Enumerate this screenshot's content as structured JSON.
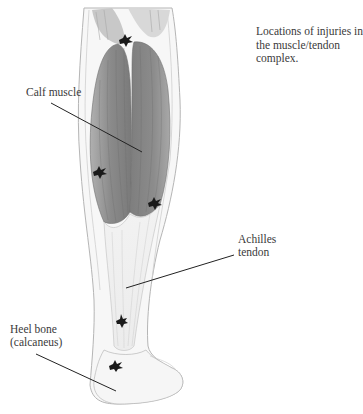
{
  "figure": {
    "caption_lines": [
      "Locations of injuries in",
      "the muscle/tendon",
      "complex."
    ],
    "labels": {
      "calf_muscle": "Calf muscle",
      "achilles_line1": "Achilles",
      "achilles_line2": "tendon",
      "heel_line1": "Heel bone",
      "heel_line2": "(calcaneus)"
    },
    "injury_markers": [
      {
        "x": 126,
        "y": 40
      },
      {
        "x": 100,
        "y": 172
      },
      {
        "x": 155,
        "y": 203
      },
      {
        "x": 122,
        "y": 321
      },
      {
        "x": 116,
        "y": 366
      }
    ],
    "colors": {
      "muscle": "#8a8a8a",
      "tendon": "#e8e8e8",
      "outline": "#9a9a9a",
      "marker": "#1a1a1a",
      "leader": "#222222"
    }
  }
}
